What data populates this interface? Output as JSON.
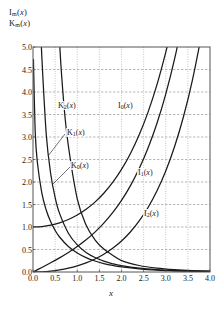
{
  "chart_data": {
    "type": "line",
    "title": "",
    "ylabel_lines": [
      "I_m(x)",
      "K_m(x)"
    ],
    "xlabel": "x",
    "xlim": [
      0.0,
      4.0
    ],
    "ylim": [
      0.0,
      5.0
    ],
    "xticks": [
      "0.0",
      "0.5",
      "1.0",
      "1.5",
      "2.0",
      "2.5",
      "3.0",
      "3.5",
      "4.0"
    ],
    "xtick_values": [
      0.0,
      0.5,
      1.0,
      1.5,
      2.0,
      2.5,
      3.0,
      3.5,
      4.0
    ],
    "yticks": [
      "0.0",
      "0.5",
      "1.0",
      "1.5",
      "2.0",
      "2.5",
      "3.0",
      "3.5",
      "4.0",
      "4.5",
      "5.0"
    ],
    "ytick_values": [
      0.0,
      0.5,
      1.0,
      1.5,
      2.0,
      2.5,
      3.0,
      3.5,
      4.0,
      4.5,
      5.0
    ],
    "grid": "both-dashed-gray",
    "legend": "inline-annotations",
    "line_color": "#1a1a1a",
    "grid_color": "#999999",
    "frame_color": "#555555",
    "annotations": [
      {
        "name": "K2",
        "label": "K₂(x)",
        "x_px": 57,
        "y_px": 101,
        "leader": false
      },
      {
        "name": "K1",
        "label": "K₁(x)",
        "x_px": 66,
        "y_px": 128,
        "leader": true,
        "leader_from": [
          65,
          134
        ],
        "leader_to": [
          48,
          156
        ]
      },
      {
        "name": "K0",
        "label": "K₀(x)",
        "x_px": 70,
        "y_px": 161,
        "leader": true,
        "leader_from": [
          70,
          167
        ],
        "leader_to": [
          53,
          184
        ]
      },
      {
        "name": "I0",
        "label": "I₀(x)",
        "x_px": 117,
        "y_px": 101,
        "leader": false
      },
      {
        "name": "I1",
        "label": "I₁(x)",
        "x_px": 137,
        "y_px": 168,
        "leader": false
      },
      {
        "name": "I2",
        "label": "I₂(x)",
        "x_px": 143,
        "y_px": 209,
        "leader": false
      }
    ],
    "series": [
      {
        "name": "I0",
        "label": "I₀(x)",
        "x": [
          0.0,
          0.2,
          0.4,
          0.6,
          0.8,
          1.0,
          1.2,
          1.4,
          1.6,
          1.8,
          2.0,
          2.2,
          2.4,
          2.6,
          2.8,
          3.0,
          3.1
        ],
        "y": [
          1.0,
          1.01,
          1.04,
          1.092,
          1.167,
          1.266,
          1.394,
          1.553,
          1.75,
          1.99,
          2.28,
          2.629,
          3.049,
          3.553,
          4.157,
          4.881,
          5.294
        ]
      },
      {
        "name": "I1",
        "label": "I₁(x)",
        "x": [
          0.0,
          0.2,
          0.4,
          0.6,
          0.8,
          1.0,
          1.2,
          1.4,
          1.6,
          1.8,
          2.0,
          2.2,
          2.4,
          2.6,
          2.8,
          3.0,
          3.2,
          3.4,
          3.5
        ],
        "y": [
          0.0,
          0.1005,
          0.204,
          0.3137,
          0.4329,
          0.5652,
          0.7147,
          0.8861,
          1.0848,
          1.3172,
          1.5906,
          1.9141,
          2.2981,
          2.7554,
          3.3011,
          3.9534,
          4.7343,
          5.6701,
          6.2058
        ]
      },
      {
        "name": "I2",
        "label": "I₂(x)",
        "x": [
          0.0,
          0.2,
          0.4,
          0.6,
          0.8,
          1.0,
          1.2,
          1.4,
          1.6,
          1.8,
          2.0,
          2.2,
          2.4,
          2.6,
          2.8,
          3.0,
          3.2,
          3.4,
          3.6,
          3.8,
          3.9
        ],
        "y": [
          0.0,
          0.005,
          0.0203,
          0.0464,
          0.0844,
          0.1357,
          0.2026,
          0.2875,
          0.394,
          0.526,
          0.6889,
          0.8891,
          1.1342,
          1.4337,
          1.7994,
          2.2452,
          2.7883,
          3.4495,
          4.254,
          5.2325,
          5.8
        ]
      },
      {
        "name": "K0",
        "label": "K₀(x)",
        "x": [
          0.01,
          0.05,
          0.1,
          0.2,
          0.3,
          0.4,
          0.5,
          0.6,
          0.8,
          1.0,
          1.2,
          1.4,
          1.6,
          1.8,
          2.0,
          2.4,
          2.8,
          3.2,
          3.6,
          4.0
        ],
        "y": [
          4.721,
          3.114,
          2.427,
          1.7527,
          1.3725,
          1.1145,
          0.9244,
          0.7775,
          0.5653,
          0.421,
          0.3185,
          0.2437,
          0.188,
          0.1459,
          0.1139,
          0.0702,
          0.0432,
          0.0276,
          0.0175,
          0.0112
        ]
      },
      {
        "name": "K1",
        "label": "K₁(x)",
        "x": [
          0.18,
          0.2,
          0.3,
          0.4,
          0.5,
          0.6,
          0.8,
          1.0,
          1.2,
          1.4,
          1.6,
          1.8,
          2.0,
          2.4,
          2.8,
          3.2,
          3.6,
          4.0
        ],
        "y": [
          5.38,
          4.776,
          3.056,
          2.184,
          1.6564,
          1.3028,
          0.8618,
          0.6019,
          0.4346,
          0.3208,
          0.2406,
          0.1826,
          0.1399,
          0.0837,
          0.0511,
          0.0316,
          0.0198,
          0.0125
        ]
      },
      {
        "name": "K2",
        "label": "K₂(x)",
        "x": [
          0.44,
          0.5,
          0.6,
          0.7,
          0.8,
          1.0,
          1.2,
          1.4,
          1.6,
          1.8,
          2.0,
          2.4,
          2.8,
          3.2,
          3.6,
          4.0
        ],
        "y": [
          9.6,
          7.55,
          5.12,
          3.701,
          2.7998,
          1.6248,
          1.0428,
          0.7159,
          0.5098,
          0.3725,
          0.2538,
          0.1443,
          0.0846,
          0.0505,
          0.0306,
          0.0188
        ]
      }
    ]
  }
}
